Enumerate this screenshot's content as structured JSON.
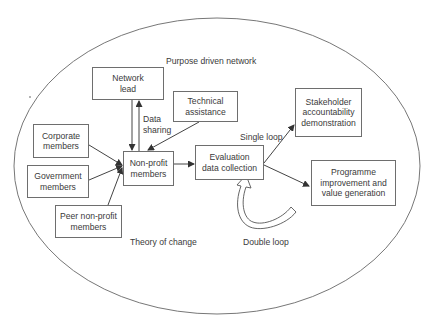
{
  "diagram": {
    "outer_label": "Purpose driven network",
    "inner_label": "Theory of change",
    "nodes": {
      "network_lead": [
        "Network",
        "lead"
      ],
      "technical_assistance": [
        "Technical",
        "assistance"
      ],
      "corporate_members": [
        "Corporate",
        "members"
      ],
      "government_members": [
        "Government",
        "members"
      ],
      "peer_nonprofit_members": [
        "Peer non-profit",
        "members"
      ],
      "nonprofit_members": [
        "Non-profit",
        "members"
      ],
      "evaluation": [
        "Evaluation",
        "data collection"
      ],
      "stakeholder": [
        "Stakeholder",
        "accountability",
        "demonstration"
      ],
      "programme": [
        "Programme",
        "improvement and",
        "value generation"
      ]
    },
    "edge_labels": {
      "data_sharing": [
        "Data",
        "sharing"
      ],
      "single_loop": "Single loop",
      "double_loop": "Double loop"
    },
    "colors": {
      "line": "#4a4a4a",
      "box_border": "#6e6e6e",
      "text": "#3a3a3a"
    }
  }
}
